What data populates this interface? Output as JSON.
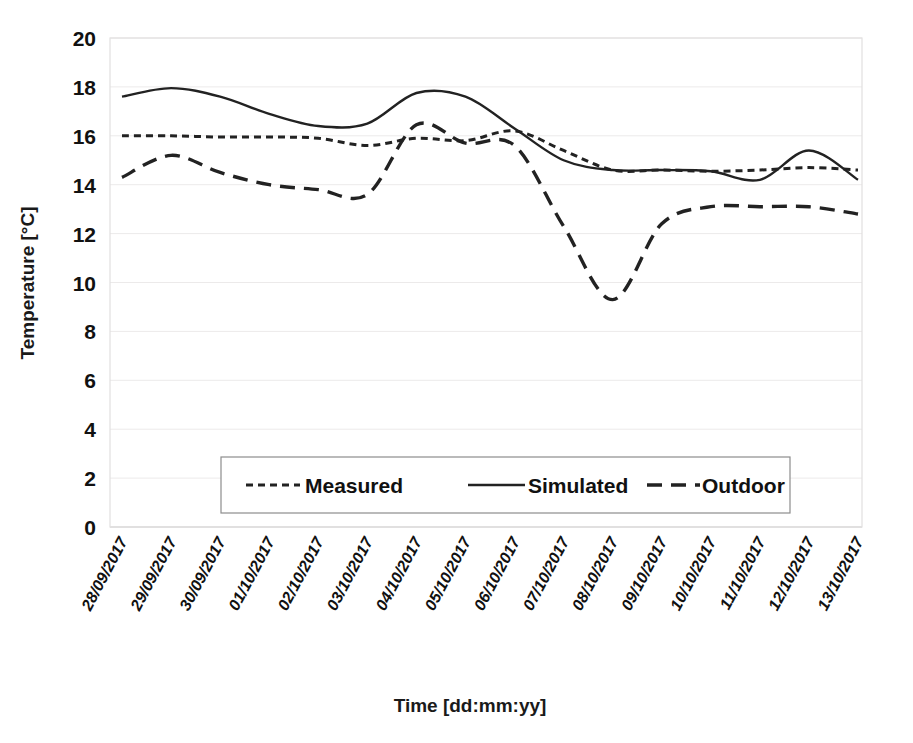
{
  "chart_data": {
    "type": "line",
    "title": "",
    "xlabel": "Time [dd:mm:yy]",
    "ylabel": "Temperature [°C]",
    "ylim": [
      0,
      20
    ],
    "ytick_step": 2,
    "yticks": [
      "20",
      "18",
      "16",
      "14",
      "12",
      "10",
      "8",
      "6",
      "4",
      "2",
      "0"
    ],
    "grid": true,
    "legend_position": "inside-bottom-center",
    "categories": [
      "28/09/2017",
      "29/09/2017",
      "30/09/2017",
      "01/10/2017",
      "02/10/2017",
      "03/10/2017",
      "04/10/2017",
      "05/10/2017",
      "06/10/2017",
      "07/10/2017",
      "08/10/2017",
      "09/10/2017",
      "10/10/2017",
      "11/10/2017",
      "12/10/2017",
      "13/10/2017"
    ],
    "series": [
      {
        "name": "Measured",
        "style": "dotted",
        "color": "#222222",
        "values": [
          16.0,
          16.0,
          15.95,
          15.95,
          15.9,
          15.6,
          15.9,
          15.8,
          16.2,
          15.4,
          14.6,
          14.6,
          14.55,
          14.6,
          14.7,
          14.6
        ]
      },
      {
        "name": "Simulated",
        "style": "solid",
        "color": "#222222",
        "values": [
          17.6,
          17.95,
          17.6,
          16.9,
          16.4,
          16.5,
          17.75,
          17.6,
          16.3,
          15.0,
          14.6,
          14.6,
          14.55,
          14.2,
          15.4,
          14.2
        ]
      },
      {
        "name": "Outdoor",
        "style": "dashed",
        "color": "#222222",
        "values": [
          14.3,
          15.2,
          14.5,
          14.0,
          13.8,
          13.6,
          16.45,
          15.7,
          15.6,
          12.3,
          9.3,
          12.4,
          13.1,
          13.1,
          13.1,
          12.8
        ]
      }
    ]
  },
  "legend": {
    "items": [
      {
        "label": "Measured",
        "style": "dotted"
      },
      {
        "label": "Simulated",
        "style": "solid"
      },
      {
        "label": "Outdoor",
        "style": "dashed"
      }
    ]
  }
}
